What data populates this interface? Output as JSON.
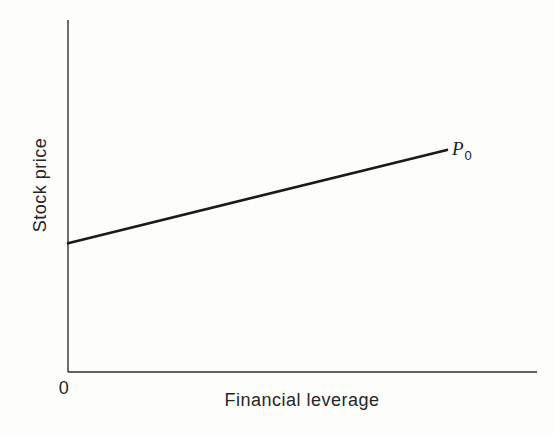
{
  "figure": {
    "background": "#fdfdfc"
  },
  "chart_data": {
    "type": "line",
    "title": "",
    "xlabel": "Financial leverage",
    "ylabel": "Stock price",
    "origin_label": "0",
    "axes": {
      "x_range": [
        0,
        1
      ],
      "y_range": [
        0,
        1
      ],
      "grid": false,
      "ticks": "none",
      "numeric_labels": "none"
    },
    "axis_color": "#2d2d2d",
    "line_color": "#1a1a1a",
    "series": [
      {
        "name": "stock-price-vs-financial-leverage",
        "label_main": "P",
        "label_sub": "0",
        "points": [
          {
            "x": 0.0,
            "y": 0.366
          },
          {
            "x": 0.808,
            "y": 0.631
          }
        ]
      }
    ]
  }
}
